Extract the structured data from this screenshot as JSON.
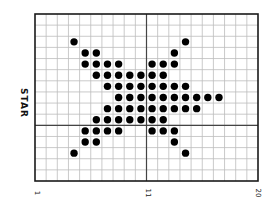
{
  "chart_data": {
    "type": "scatter",
    "title": "",
    "ylabel": "STAR",
    "xlabel": "",
    "grid": true,
    "grid_cols": 20,
    "grid_rows": 15,
    "x_ticks": [
      {
        "label": "1",
        "col_boundary": 0
      },
      {
        "label": "11",
        "col_boundary": 10
      },
      {
        "label": "20",
        "col_boundary": 20
      }
    ],
    "axis_divider": {
      "vertical_col_boundary": 10,
      "horizontal_row_boundary": 10
    },
    "colors": {
      "dot": "#000000",
      "grid": "#bdbdbd",
      "frame": "#1a1a1a",
      "background": "#ffffff"
    },
    "points_row_col": [
      [
        2,
        3
      ],
      [
        2,
        13
      ],
      [
        3,
        4
      ],
      [
        3,
        5
      ],
      [
        3,
        12
      ],
      [
        4,
        4
      ],
      [
        4,
        5
      ],
      [
        4,
        6
      ],
      [
        4,
        7
      ],
      [
        4,
        10
      ],
      [
        4,
        11
      ],
      [
        4,
        12
      ],
      [
        5,
        5
      ],
      [
        5,
        6
      ],
      [
        5,
        7
      ],
      [
        5,
        8
      ],
      [
        5,
        9
      ],
      [
        5,
        10
      ],
      [
        5,
        11
      ],
      [
        6,
        6
      ],
      [
        6,
        7
      ],
      [
        6,
        8
      ],
      [
        6,
        9
      ],
      [
        6,
        10
      ],
      [
        6,
        11
      ],
      [
        6,
        12
      ],
      [
        6,
        13
      ],
      [
        7,
        7
      ],
      [
        7,
        8
      ],
      [
        7,
        9
      ],
      [
        7,
        10
      ],
      [
        7,
        11
      ],
      [
        7,
        12
      ],
      [
        7,
        13
      ],
      [
        7,
        14
      ],
      [
        7,
        15
      ],
      [
        7,
        16
      ],
      [
        8,
        6
      ],
      [
        8,
        7
      ],
      [
        8,
        8
      ],
      [
        8,
        9
      ],
      [
        8,
        10
      ],
      [
        8,
        11
      ],
      [
        8,
        12
      ],
      [
        8,
        13
      ],
      [
        8,
        14
      ],
      [
        9,
        5
      ],
      [
        9,
        6
      ],
      [
        9,
        7
      ],
      [
        9,
        8
      ],
      [
        9,
        9
      ],
      [
        9,
        10
      ],
      [
        9,
        11
      ],
      [
        10,
        4
      ],
      [
        10,
        5
      ],
      [
        10,
        6
      ],
      [
        10,
        7
      ],
      [
        10,
        10
      ],
      [
        10,
        11
      ],
      [
        10,
        12
      ],
      [
        11,
        4
      ],
      [
        11,
        5
      ],
      [
        11,
        12
      ],
      [
        12,
        3
      ],
      [
        12,
        13
      ]
    ]
  },
  "labels": {
    "ylabel": "STAR",
    "tick_1": "1",
    "tick_11": "11",
    "tick_20": "20"
  }
}
